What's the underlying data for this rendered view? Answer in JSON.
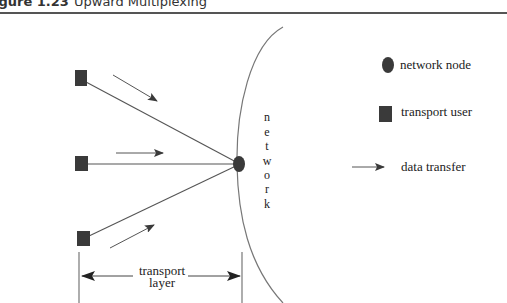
{
  "figure": {
    "number": "Figure 1.23",
    "number_visible": "igure 1.23",
    "title": "Upward Multiplexing"
  },
  "diagram": {
    "network_label_letters": [
      "n",
      "e",
      "t",
      "w",
      "o",
      "r",
      "k"
    ],
    "transport_layer_label": {
      "line1": "transport",
      "line2": "layer"
    },
    "transport_users": [
      {
        "id": "user-top"
      },
      {
        "id": "user-middle"
      },
      {
        "id": "user-bottom"
      }
    ],
    "network_node": {
      "id": "node-1"
    },
    "data_transfer_arrows": 3
  },
  "legend": {
    "items": [
      {
        "icon": "circle-icon",
        "label": "network node"
      },
      {
        "icon": "square-icon",
        "label": "transport user"
      },
      {
        "icon": "arrow-icon",
        "label": "data transfer"
      }
    ]
  },
  "colors": {
    "shape_fill": "#3a3a3a",
    "line": "#555555",
    "curve": "#777777",
    "text": "#222222"
  }
}
